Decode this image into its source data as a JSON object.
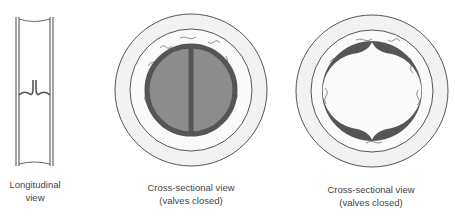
{
  "figure": {
    "panels": [
      {
        "id": "longitudinal",
        "label_line1": "Longitudinal",
        "label_line2": "view"
      },
      {
        "id": "cross-closed-1",
        "label_line1": "Cross-sectional view",
        "label_line2": "(valves closed)"
      },
      {
        "id": "cross-closed-2",
        "label_line1": "Cross-sectional view",
        "label_line2": "(valves closed)"
      }
    ],
    "colors": {
      "outline": "#555555",
      "ring_fill": "#eeeeee",
      "valve_dark": "#555555",
      "valve_fill": "#8c8c8c",
      "background": "#ffffff"
    }
  }
}
